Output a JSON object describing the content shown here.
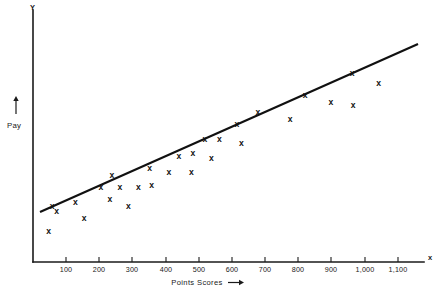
{
  "chart_data": {
    "type": "scatter",
    "title": "",
    "xlabel": "Points Scores",
    "ylabel": "Pay",
    "x_axis_symbol": "x",
    "y_axis_symbol": "Y",
    "xlim": [
      0,
      1150
    ],
    "ylim": [
      0,
      100
    ],
    "grid": false,
    "legend": null,
    "x_tick_labels": [
      "100",
      "200",
      "300",
      "400",
      "500",
      "600",
      "700",
      "800",
      "900",
      "1,000",
      "1,100"
    ],
    "x_tick_values": [
      100,
      200,
      300,
      400,
      500,
      600,
      700,
      800,
      900,
      1000,
      1100
    ],
    "y_tick_labels": [],
    "marker": "x",
    "series": [
      {
        "name": "Pay vs Points Scores",
        "points": [
          {
            "x": 48,
            "y": 13
          },
          {
            "x": 58,
            "y": 23
          },
          {
            "x": 72,
            "y": 21
          },
          {
            "x": 128,
            "y": 25
          },
          {
            "x": 155,
            "y": 18
          },
          {
            "x": 205,
            "y": 31
          },
          {
            "x": 232,
            "y": 26
          },
          {
            "x": 238,
            "y": 36
          },
          {
            "x": 262,
            "y": 31
          },
          {
            "x": 288,
            "y": 23
          },
          {
            "x": 318,
            "y": 31
          },
          {
            "x": 352,
            "y": 39
          },
          {
            "x": 358,
            "y": 32
          },
          {
            "x": 410,
            "y": 37
          },
          {
            "x": 440,
            "y": 44
          },
          {
            "x": 478,
            "y": 37
          },
          {
            "x": 482,
            "y": 45
          },
          {
            "x": 518,
            "y": 51
          },
          {
            "x": 538,
            "y": 43
          },
          {
            "x": 562,
            "y": 51
          },
          {
            "x": 615,
            "y": 57
          },
          {
            "x": 628,
            "y": 49
          },
          {
            "x": 678,
            "y": 62
          },
          {
            "x": 775,
            "y": 59
          },
          {
            "x": 820,
            "y": 69
          },
          {
            "x": 898,
            "y": 66
          },
          {
            "x": 962,
            "y": 78
          },
          {
            "x": 965,
            "y": 65
          },
          {
            "x": 1042,
            "y": 74
          }
        ]
      }
    ],
    "trend_line": {
      "type": "linear-fit",
      "x_start": 25,
      "y_start": 18,
      "x_end": 1130,
      "y_end": 82
    }
  }
}
